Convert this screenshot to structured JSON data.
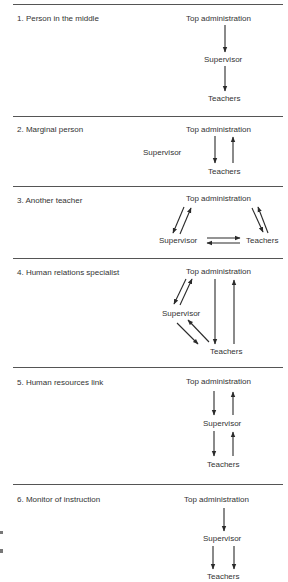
{
  "panels": [
    {
      "number": "1.",
      "title": "1.  Person in the middle",
      "nodes": {
        "top": "Top administration",
        "supervisor": "Supervisor",
        "teachers": "Teachers"
      }
    },
    {
      "number": "2.",
      "title": "2.  Marginal person",
      "nodes": {
        "top": "Top administration",
        "supervisor": "Supervisor",
        "teachers": "Teachers"
      }
    },
    {
      "number": "3.",
      "title": "3.  Another teacher",
      "nodes": {
        "top": "Top administration",
        "supervisor": "Supervisor",
        "teachers": "Teachers"
      }
    },
    {
      "number": "4.",
      "title": "4.  Human relations specialist",
      "nodes": {
        "top": "Top administration",
        "supervisor": "Supervisor",
        "teachers": "Teachers"
      }
    },
    {
      "number": "5.",
      "title": "5.  Human resources link",
      "nodes": {
        "top": "Top administration",
        "supervisor": "Supervisor",
        "teachers": "Teachers"
      }
    },
    {
      "number": "6.",
      "title": "6.  Monitor of instruction",
      "nodes": {
        "top": "Top administration",
        "supervisor": "Supervisor",
        "teachers": "Teachers"
      }
    }
  ],
  "colors": {
    "line": "#2a2a2a",
    "rule": "#555555"
  }
}
